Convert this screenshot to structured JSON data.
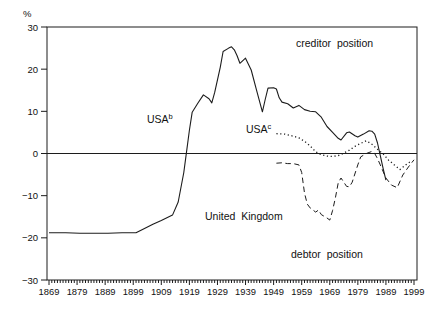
{
  "chart_data": {
    "type": "line",
    "title": "",
    "xlabel": "",
    "ylabel": "%",
    "x_range": [
      1869,
      1999
    ],
    "y_range": [
      -30,
      30
    ],
    "y_ticks": [
      30,
      20,
      10,
      0,
      -10,
      -20,
      -30
    ],
    "x_tick_labels": [
      1869,
      1879,
      1889,
      1899,
      1909,
      1919,
      1929,
      1939,
      1949,
      1959,
      1969,
      1979,
      1989,
      1999
    ],
    "minor_x_tick_every_years": 1,
    "major_x_tick_every_years": 10,
    "grid": false,
    "zero_line": true,
    "legend": "inline-annotations",
    "line_color": "#1c1c1c",
    "background_color": "#ffffff",
    "annotations": [
      {
        "id": "creditor-position",
        "text": "creditor position"
      },
      {
        "id": "usa-b",
        "text": "USA",
        "sup": "b"
      },
      {
        "id": "usa-c",
        "text": "USA",
        "sup": "c"
      },
      {
        "id": "united-kingdom",
        "text": "United Kingdom"
      },
      {
        "id": "debtor-position",
        "text": "debtor position"
      }
    ],
    "series": [
      {
        "id": "usa-b",
        "name": "USA (b)",
        "style": "solid",
        "points": [
          [
            1869,
            -18.8
          ],
          [
            1875,
            -18.8
          ],
          [
            1880,
            -18.9
          ],
          [
            1885,
            -18.9
          ],
          [
            1890,
            -18.9
          ],
          [
            1895,
            -18.8
          ],
          [
            1900,
            -18.8
          ],
          [
            1903,
            -17.8
          ],
          [
            1906,
            -16.8
          ],
          [
            1909,
            -15.9
          ],
          [
            1913,
            -14.6
          ],
          [
            1915,
            -11.5
          ],
          [
            1917,
            -4.5
          ],
          [
            1918,
            0.5
          ],
          [
            1919,
            5.5
          ],
          [
            1920,
            9.8
          ],
          [
            1922,
            11.9
          ],
          [
            1924,
            13.9
          ],
          [
            1926,
            13.0
          ],
          [
            1927,
            12.0
          ],
          [
            1928,
            14.5
          ],
          [
            1930,
            20.5
          ],
          [
            1931,
            24.2
          ],
          [
            1933,
            25.0
          ],
          [
            1934,
            25.3
          ],
          [
            1935,
            24.6
          ],
          [
            1936,
            23.2
          ],
          [
            1937,
            21.4
          ],
          [
            1939,
            22.6
          ],
          [
            1941,
            19.8
          ],
          [
            1943,
            14.8
          ],
          [
            1945,
            9.9
          ],
          [
            1946,
            12.8
          ],
          [
            1947,
            15.5
          ],
          [
            1949,
            15.6
          ],
          [
            1950,
            15.3
          ],
          [
            1951,
            13.2
          ],
          [
            1952,
            12.2
          ],
          [
            1954,
            11.8
          ],
          [
            1956,
            10.8
          ],
          [
            1958,
            11.4
          ],
          [
            1960,
            10.4
          ],
          [
            1962,
            10.0
          ],
          [
            1964,
            9.9
          ],
          [
            1966,
            8.6
          ],
          [
            1968,
            6.4
          ],
          [
            1970,
            5.0
          ],
          [
            1972,
            3.6
          ],
          [
            1973,
            3.2
          ],
          [
            1975,
            4.9
          ],
          [
            1976,
            5.1
          ],
          [
            1978,
            4.2
          ],
          [
            1979,
            3.9
          ],
          [
            1981,
            4.6
          ],
          [
            1983,
            5.4
          ],
          [
            1984,
            5.3
          ],
          [
            1985,
            4.6
          ],
          [
            1986,
            2.5
          ],
          [
            1987,
            -0.5
          ],
          [
            1988,
            -3.5
          ],
          [
            1989,
            -6.3
          ]
        ]
      },
      {
        "id": "usa-c",
        "name": "USA (c)",
        "style": "dotted",
        "points": [
          [
            1950,
            4.7
          ],
          [
            1953,
            4.6
          ],
          [
            1956,
            4.1
          ],
          [
            1958,
            3.7
          ],
          [
            1960,
            2.9
          ],
          [
            1962,
            1.8
          ],
          [
            1964,
            0.4
          ],
          [
            1966,
            -0.3
          ],
          [
            1968,
            -0.6
          ],
          [
            1970,
            -0.7
          ],
          [
            1972,
            -0.5
          ],
          [
            1974,
            0.1
          ],
          [
            1976,
            0.8
          ],
          [
            1978,
            1.7
          ],
          [
            1980,
            2.4
          ],
          [
            1982,
            3.0
          ],
          [
            1984,
            2.2
          ],
          [
            1986,
            1.0
          ],
          [
            1988,
            -0.1
          ],
          [
            1990,
            -1.6
          ],
          [
            1992,
            -2.7
          ],
          [
            1994,
            -3.8
          ],
          [
            1996,
            -2.7
          ],
          [
            1998,
            -1.8
          ]
        ]
      },
      {
        "id": "united-kingdom",
        "name": "United Kingdom",
        "style": "dashed",
        "points": [
          [
            1950,
            -2.3
          ],
          [
            1952,
            -2.2
          ],
          [
            1954,
            -2.4
          ],
          [
            1956,
            -2.4
          ],
          [
            1958,
            -2.7
          ],
          [
            1959,
            -4.5
          ],
          [
            1960,
            -9.4
          ],
          [
            1961,
            -12.0
          ],
          [
            1962,
            -12.9
          ],
          [
            1964,
            -13.9
          ],
          [
            1965,
            -13.4
          ],
          [
            1966,
            -14.5
          ],
          [
            1968,
            -15.3
          ],
          [
            1969,
            -15.8
          ],
          [
            1970,
            -13.5
          ],
          [
            1971,
            -10.5
          ],
          [
            1972,
            -7.0
          ],
          [
            1973,
            -5.8
          ],
          [
            1975,
            -7.8
          ],
          [
            1976,
            -7.9
          ],
          [
            1977,
            -6.8
          ],
          [
            1979,
            -2.7
          ],
          [
            1980,
            -0.8
          ],
          [
            1982,
            0.0
          ],
          [
            1984,
            0.5
          ],
          [
            1985,
            0.0
          ],
          [
            1986,
            -1.2
          ],
          [
            1987,
            -2.7
          ],
          [
            1989,
            -5.8
          ],
          [
            1991,
            -7.5
          ],
          [
            1993,
            -8.1
          ],
          [
            1995,
            -5.1
          ],
          [
            1997,
            -3.2
          ],
          [
            1999,
            -1.5
          ]
        ]
      }
    ]
  }
}
